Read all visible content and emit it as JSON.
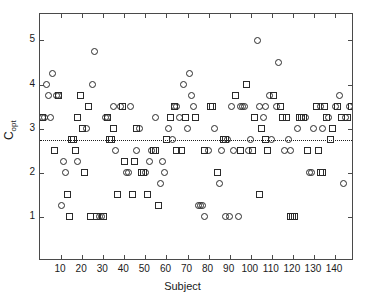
{
  "chart_data": {
    "type": "scatter",
    "title": "",
    "xlabel": "Subject",
    "ylabel": "C_opt",
    "ylabel_base": "C",
    "ylabel_sub": "opt",
    "xlim": [
      0,
      149
    ],
    "ylim": [
      0,
      5.6
    ],
    "xticks": [
      10,
      20,
      30,
      40,
      50,
      60,
      70,
      80,
      90,
      100,
      110,
      120,
      130,
      140
    ],
    "yticks": [
      1,
      2,
      3,
      4,
      5
    ],
    "grid": false,
    "legend": null,
    "marker_colors": {
      "edge": "#2b2b2b",
      "face": "none"
    },
    "axis_color": "#4a4a4a",
    "background": "#ffffff",
    "reference_line": {
      "type": "horizontal-dotted",
      "value": 2.75,
      "color": "#1f1f1f",
      "label": ""
    },
    "series": [
      {
        "name": "circles",
        "marker": "circle",
        "points": [
          [
            1,
            3.25
          ],
          [
            2,
            3.25
          ],
          [
            3,
            4.0
          ],
          [
            4,
            3.75
          ],
          [
            5,
            3.25
          ],
          [
            6,
            4.25
          ],
          [
            8,
            3.75
          ],
          [
            9,
            3.75
          ],
          [
            10,
            1.25
          ],
          [
            11,
            2.25
          ],
          [
            12,
            2.0
          ],
          [
            18,
            2.25
          ],
          [
            22,
            3.0
          ],
          [
            25,
            4.0
          ],
          [
            26,
            4.75
          ],
          [
            28,
            1.0
          ],
          [
            29,
            1.0
          ],
          [
            31,
            3.25
          ],
          [
            32,
            3.25
          ],
          [
            35,
            3.5
          ],
          [
            36,
            2.5
          ],
          [
            38,
            3.5
          ],
          [
            41,
            2.0
          ],
          [
            42,
            2.0
          ],
          [
            43,
            3.5
          ],
          [
            46,
            2.5
          ],
          [
            47,
            3.0
          ],
          [
            50,
            2.0
          ],
          [
            52,
            2.25
          ],
          [
            53,
            2.5
          ],
          [
            55,
            3.25
          ],
          [
            57,
            1.75
          ],
          [
            58,
            2.25
          ],
          [
            59,
            2.0
          ],
          [
            61,
            3.0
          ],
          [
            63,
            2.75
          ],
          [
            64,
            3.5
          ],
          [
            65,
            3.5
          ],
          [
            66,
            3.25
          ],
          [
            68,
            4.0
          ],
          [
            70,
            3.0
          ],
          [
            71,
            4.25
          ],
          [
            72,
            3.75
          ],
          [
            73,
            3.5
          ],
          [
            75,
            1.25
          ],
          [
            76,
            1.25
          ],
          [
            77,
            1.25
          ],
          [
            78,
            1.0
          ],
          [
            80,
            2.5
          ],
          [
            83,
            3.0
          ],
          [
            85,
            1.75
          ],
          [
            86,
            2.5
          ],
          [
            88,
            1.0
          ],
          [
            89,
            2.75
          ],
          [
            90,
            1.0
          ],
          [
            91,
            3.5
          ],
          [
            92,
            2.5
          ],
          [
            94,
            1.0
          ],
          [
            95,
            3.5
          ],
          [
            96,
            3.5
          ],
          [
            97,
            3.5
          ],
          [
            99,
            2.5
          ],
          [
            100,
            2.75
          ],
          [
            103,
            5.0
          ],
          [
            104,
            3.5
          ],
          [
            106,
            3.25
          ],
          [
            107,
            3.5
          ],
          [
            109,
            3.75
          ],
          [
            110,
            2.75
          ],
          [
            112,
            3.5
          ],
          [
            113,
            4.5
          ],
          [
            116,
            2.5
          ],
          [
            118,
            2.75
          ],
          [
            119,
            2.5
          ],
          [
            122,
            3.0
          ],
          [
            126,
            3.25
          ],
          [
            128,
            2.0
          ],
          [
            129,
            2.0
          ],
          [
            130,
            3.0
          ],
          [
            133,
            3.5
          ],
          [
            134,
            3.0
          ],
          [
            137,
            3.25
          ],
          [
            140,
            3.5
          ],
          [
            142,
            3.75
          ],
          [
            144,
            1.75
          ],
          [
            145,
            3.25
          ],
          [
            147,
            3.5
          ]
        ]
      },
      {
        "name": "squares",
        "marker": "square",
        "points": [
          [
            1,
            3.25
          ],
          [
            7,
            2.5
          ],
          [
            9,
            3.75
          ],
          [
            13,
            1.5
          ],
          [
            14,
            1.0
          ],
          [
            15,
            2.75
          ],
          [
            16,
            2.75
          ],
          [
            17,
            2.5
          ],
          [
            18,
            3.25
          ],
          [
            19,
            3.75
          ],
          [
            20,
            3.0
          ],
          [
            21,
            2.0
          ],
          [
            23,
            3.5
          ],
          [
            24,
            1.0
          ],
          [
            27,
            1.0
          ],
          [
            30,
            1.0
          ],
          [
            32,
            3.25
          ],
          [
            33,
            2.75
          ],
          [
            34,
            2.75
          ],
          [
            35,
            3.0
          ],
          [
            37,
            1.5
          ],
          [
            39,
            3.5
          ],
          [
            40,
            2.25
          ],
          [
            44,
            1.5
          ],
          [
            45,
            2.25
          ],
          [
            46,
            3.0
          ],
          [
            48,
            2.0
          ],
          [
            49,
            2.0
          ],
          [
            51,
            1.5
          ],
          [
            54,
            2.5
          ],
          [
            55,
            2.5
          ],
          [
            56,
            1.25
          ],
          [
            60,
            2.75
          ],
          [
            62,
            3.25
          ],
          [
            64,
            3.5
          ],
          [
            65,
            2.5
          ],
          [
            67,
            2.5
          ],
          [
            69,
            3.25
          ],
          [
            74,
            3.25
          ],
          [
            78,
            2.5
          ],
          [
            81,
            3.5
          ],
          [
            82,
            3.5
          ],
          [
            84,
            2.0
          ],
          [
            87,
            2.75
          ],
          [
            88,
            2.75
          ],
          [
            93,
            3.75
          ],
          [
            95,
            2.5
          ],
          [
            98,
            4.0
          ],
          [
            101,
            2.5
          ],
          [
            102,
            3.25
          ],
          [
            104,
            1.5
          ],
          [
            105,
            3.0
          ],
          [
            107,
            2.75
          ],
          [
            108,
            2.5
          ],
          [
            111,
            3.75
          ],
          [
            114,
            3.5
          ],
          [
            115,
            3.25
          ],
          [
            117,
            3.25
          ],
          [
            119,
            1.0
          ],
          [
            120,
            1.0
          ],
          [
            121,
            1.0
          ],
          [
            123,
            3.25
          ],
          [
            124,
            3.25
          ],
          [
            125,
            3.25
          ],
          [
            127,
            2.5
          ],
          [
            131,
            3.5
          ],
          [
            132,
            2.5
          ],
          [
            133,
            2.0
          ],
          [
            134,
            2.0
          ],
          [
            135,
            3.5
          ],
          [
            136,
            3.25
          ],
          [
            138,
            2.75
          ],
          [
            139,
            3.0
          ],
          [
            141,
            3.5
          ],
          [
            143,
            3.25
          ],
          [
            146,
            3.25
          ],
          [
            148,
            3.5
          ]
        ]
      }
    ]
  }
}
